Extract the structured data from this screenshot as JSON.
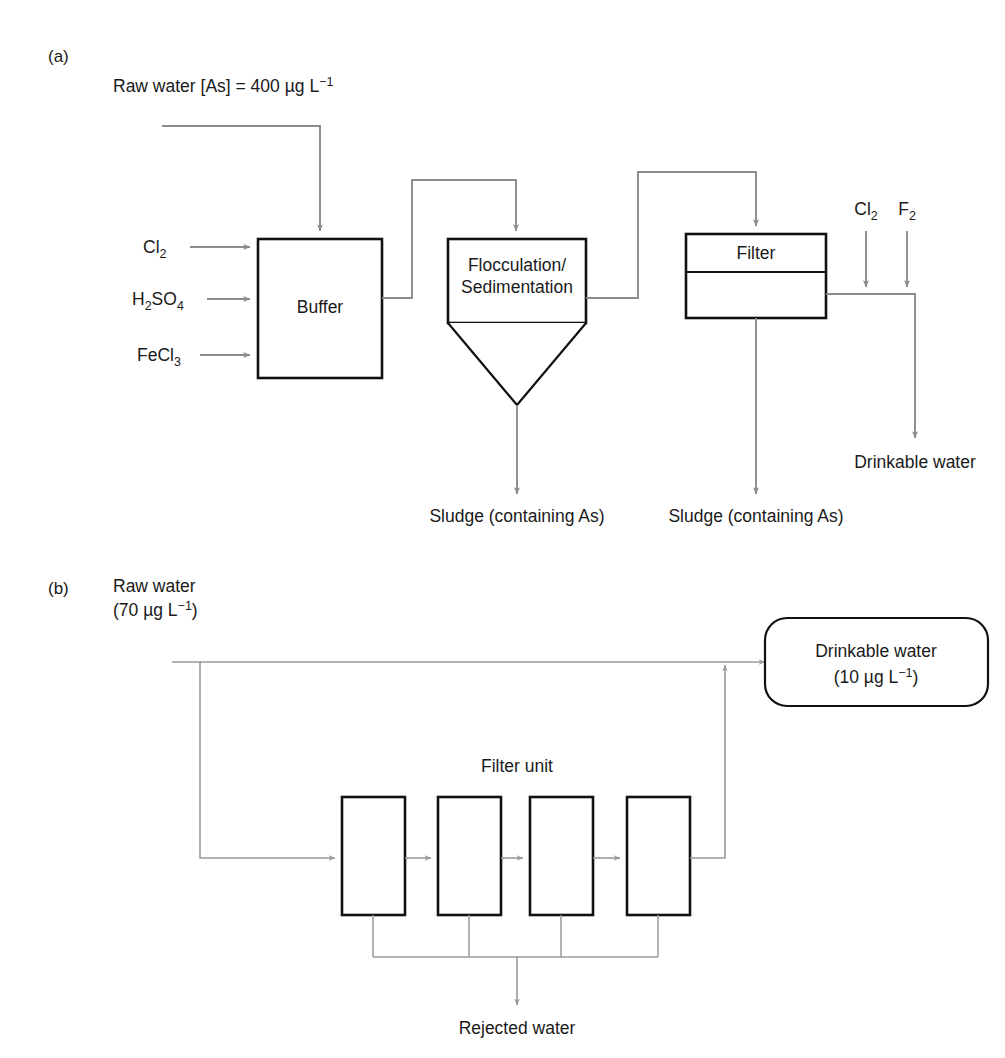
{
  "figure": {
    "panels": [
      {
        "key": "a",
        "label": "(a)"
      },
      {
        "key": "b",
        "label": "(b)"
      }
    ]
  },
  "panel_a": {
    "panel_label": "(a)",
    "inlet": {
      "text_main": "Raw water [As] = 400 ",
      "mu": "µ",
      "g_l": "g L",
      "exponent": "−1"
    },
    "inlet_full": "Raw water [As] = 400 µg L−1",
    "chemicals": [
      {
        "name": "chlorine",
        "base": "Cl",
        "sub": "2"
      },
      {
        "name": "sulfuric-acid",
        "base": "H",
        "sub": "2",
        "base2": "SO",
        "sub2": "4"
      },
      {
        "name": "ferric-chloride",
        "base": "FeCl",
        "sub": "3"
      }
    ],
    "chemical_labels": {
      "cl2": "Cl2",
      "h2so4": "H2SO4",
      "fecl3": "FeCl3"
    },
    "units": {
      "buffer": "Buffer",
      "flocculation_line1": "Flocculation/",
      "flocculation_line2": "Sedimentation",
      "filter": "Filter"
    },
    "dosing": {
      "cl2_base": "Cl",
      "cl2_sub": "2",
      "f2_base": "F",
      "f2_sub": "2"
    },
    "outputs": {
      "sludge_sedimentation": "Sludge (containing As)",
      "sludge_filter": "Sludge (containing As)",
      "drinkable_water": "Drinkable water"
    }
  },
  "panel_b": {
    "panel_label": "(b)",
    "inlet": {
      "line1": "Raw water",
      "line2_open": "(70 ",
      "mu": "µ",
      "g_l": "g L",
      "exponent": "−1",
      "line2_close": ")"
    },
    "inlet_full": "Raw water (70 µg L−1)",
    "filter_unit_label": "Filter unit",
    "filter_boxes": [
      {
        "name": "filter-stage-1"
      },
      {
        "name": "filter-stage-2"
      },
      {
        "name": "filter-stage-3"
      },
      {
        "name": "filter-stage-4"
      }
    ],
    "product": {
      "line1": "Drinkable water",
      "line2_open": "(10 ",
      "mu": "µ",
      "g_l": "g L",
      "exponent": "−1",
      "line2_close": ")"
    },
    "product_full": "Drinkable water (10 µg L−1)",
    "reject": "Rejected water"
  },
  "colors": {
    "pipe": "#8c8c8c",
    "outline": "#111111",
    "text": "#1a1a1a",
    "background": "#ffffff"
  }
}
